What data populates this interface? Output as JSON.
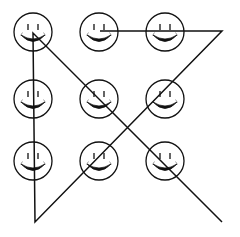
{
  "diagram": {
    "width": 240,
    "height": 237,
    "stroke_color": "#111111",
    "background": "#ffffff",
    "face": {
      "radius": 19,
      "eye_offset_x": 5,
      "eye_top": -8,
      "eye_bottom": -2,
      "smile_half_width": 12,
      "smile_y": 3,
      "smile_depth": 13
    },
    "faces": [
      {
        "row": 1,
        "col": 1,
        "cx": 33,
        "cy": 32
      },
      {
        "row": 1,
        "col": 2,
        "cx": 99,
        "cy": 32
      },
      {
        "row": 1,
        "col": 3,
        "cx": 165,
        "cy": 32
      },
      {
        "row": 2,
        "col": 1,
        "cx": 33,
        "cy": 99
      },
      {
        "row": 2,
        "col": 2,
        "cx": 99,
        "cy": 99
      },
      {
        "row": 2,
        "col": 3,
        "cx": 165,
        "cy": 99
      },
      {
        "row": 3,
        "col": 1,
        "cx": 33,
        "cy": 161
      },
      {
        "row": 3,
        "col": 2,
        "cx": 99,
        "cy": 161
      },
      {
        "row": 3,
        "col": 3,
        "cx": 165,
        "cy": 161
      }
    ],
    "path": {
      "description": "Single continuous line drawn across the grid",
      "points": [
        [
          100,
          31
        ],
        [
          222,
          31
        ],
        [
          35,
          222
        ],
        [
          33,
          33
        ],
        [
          222,
          222
        ]
      ],
      "stroke_width": 1.5
    }
  }
}
